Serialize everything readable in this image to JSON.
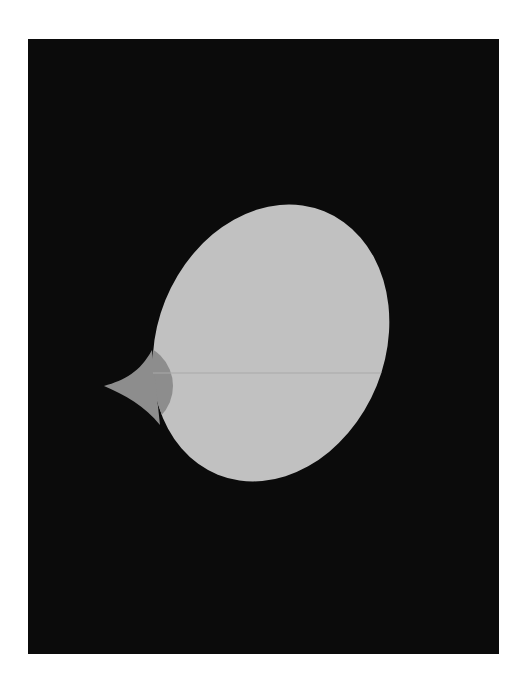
{
  "scene": {
    "description": "Abstract minimalist bird/egg silhouette on black panel",
    "colors": {
      "page": "#ffffff",
      "panel": "#0b0b0b",
      "body": "#c1c1c1",
      "beak": "#8d8d8d",
      "seam": "#a9a9a9"
    }
  }
}
